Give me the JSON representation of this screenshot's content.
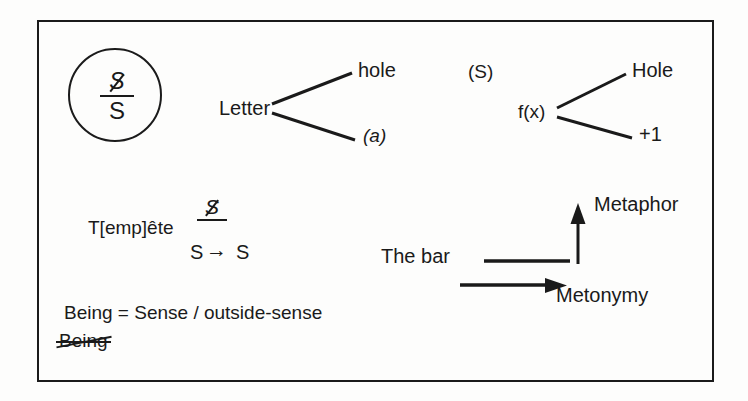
{
  "diagram": {
    "title_region": "lacanian-schema-notes",
    "frame": {
      "border_color": "#1b1b1b"
    },
    "background_color": "#fdfdfc",
    "ink_color": "#1a1a1a",
    "circle_node": {
      "numerator": "S",
      "numerator_note": "barred-S",
      "denominator": "S"
    },
    "branch_left": {
      "root": "Letter",
      "upper": "hole",
      "lower": "(a)",
      "lower_style": "italic"
    },
    "branch_right": {
      "label": "(S)",
      "root": "f(x)",
      "upper": "Hole",
      "lower": "+1"
    },
    "formula_row": {
      "word": "T[emp]ête",
      "fraction_numerator": "S",
      "fraction_numerator_note": "barred-S",
      "fraction_denominator": "S",
      "arrow": "→",
      "result": "S"
    },
    "bar_group": {
      "label": "The bar",
      "vertical_axis_label": "Metaphor",
      "horizontal_axis_label": "Metonymy"
    },
    "being_lines": {
      "equation": "Being = Sense / outside-sense",
      "struck_word": "Being"
    }
  }
}
